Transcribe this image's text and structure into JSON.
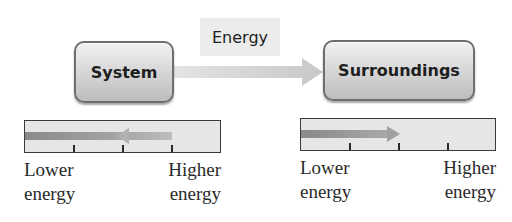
{
  "diagram": {
    "flow_label": "Energy",
    "source_box": {
      "label": "System"
    },
    "target_box": {
      "label": "Surroundings"
    },
    "colors": {
      "box_border": "#6e6e6e",
      "box_fill_top": "#f2f2f2",
      "box_fill_bottom": "#bdbdbd",
      "flow_arrow": "#d0d0d0",
      "bar_fill": "#e6e6e6",
      "bar_arrow_dark": "#8a8a8a",
      "bar_arrow_light": "#b5b5b5"
    }
  },
  "scales": [
    {
      "name": "system-energy-scale",
      "arrow_direction": "left",
      "arrow_from_tick": 3,
      "arrow_to": "start",
      "ticks": 3,
      "low_label_line1": "Lower",
      "low_label_line2": "energy",
      "high_label_line1": "Higher",
      "high_label_line2": "energy"
    },
    {
      "name": "surroundings-energy-scale",
      "arrow_direction": "right",
      "arrow_from": "start",
      "arrow_to_tick": 2,
      "ticks": 3,
      "low_label_line1": "Lower",
      "low_label_line2": "energy",
      "high_label_line1": "Higher",
      "high_label_line2": "energy"
    }
  ]
}
